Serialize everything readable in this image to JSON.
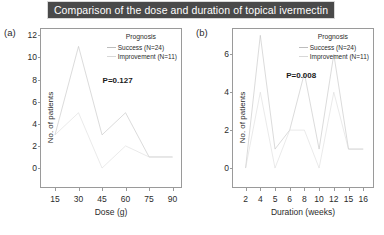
{
  "header": {
    "title": "Comparison of the dose and duration of topical ivermectin",
    "title_bg": "#4a4a4a",
    "title_color": "#ffffff"
  },
  "legend": {
    "title": "Prognosis",
    "entries": [
      {
        "label": "Success (N=24)",
        "color": "#bdbdbd"
      },
      {
        "label": "Improvement (N=11)",
        "color": "#d8d8d8"
      }
    ]
  },
  "panels": [
    {
      "id": "a",
      "label": "(a)",
      "pvalue": "P=0.127",
      "xlabel": "Dose (g)",
      "ylabel": "No. of patients",
      "xticks": [
        "15",
        "30",
        "45",
        "60",
        "75",
        "90"
      ],
      "yticks": [
        "0",
        "2",
        "4",
        "6",
        "8",
        "10",
        "12"
      ]
    },
    {
      "id": "b",
      "label": "(b)",
      "pvalue": "P=0.008",
      "xlabel": "Duration (weeks)",
      "ylabel": "No. of patients",
      "xticks": [
        "2",
        "4",
        "5",
        "6",
        "8",
        "10",
        "12",
        "15",
        "16"
      ],
      "yticks": [
        "0",
        "2",
        "4",
        "6"
      ]
    }
  ],
  "chart_data": [
    {
      "type": "line",
      "panel": "a",
      "title": "Comparison of the dose and duration of topical ivermectin",
      "annotation": "P=0.127",
      "xlabel": "Dose (g)",
      "ylabel": "No. of patients",
      "categories": [
        15,
        30,
        45,
        60,
        75,
        90
      ],
      "xlim": [
        15,
        90
      ],
      "ylim": [
        0,
        12
      ],
      "grid": false,
      "legend_position": "top-right",
      "legend_title": "Prognosis",
      "series": [
        {
          "name": "Success (N=24)",
          "color": "#bdbdbd",
          "values": [
            3,
            11,
            3,
            5,
            1,
            1
          ]
        },
        {
          "name": "Improvement (N=11)",
          "color": "#d8d8d8",
          "values": [
            3,
            5,
            0,
            2,
            1,
            1
          ]
        }
      ]
    },
    {
      "type": "line",
      "panel": "b",
      "title": "Comparison of the dose and duration of topical ivermectin",
      "annotation": "P=0.008",
      "xlabel": "Duration (weeks)",
      "ylabel": "No. of patients",
      "categories": [
        2,
        4,
        5,
        6,
        8,
        10,
        12,
        15,
        16
      ],
      "xlim": [
        2,
        16
      ],
      "ylim": [
        0,
        7
      ],
      "grid": false,
      "legend_position": "top-right",
      "legend_title": "Prognosis",
      "series": [
        {
          "name": "Success (N=24)",
          "color": "#bdbdbd",
          "values": [
            0,
            7,
            1,
            2,
            5,
            1,
            6,
            1,
            1
          ]
        },
        {
          "name": "Improvement (N=11)",
          "color": "#d8d8d8",
          "values": [
            0,
            4,
            0,
            2,
            2,
            0,
            4,
            1,
            1
          ]
        }
      ]
    }
  ]
}
